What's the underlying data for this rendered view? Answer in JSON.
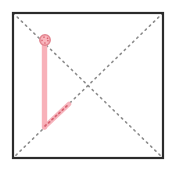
{
  "figure": {
    "canvas": {
      "width": 175,
      "height": 173,
      "background": "#ffffff"
    },
    "square": {
      "label": "square-outline",
      "x": 13,
      "y": 13,
      "width": 150,
      "height": 145,
      "stroke": "#2b2b2b",
      "stroke_width": 2.2,
      "fill": "none"
    },
    "diagonals": [
      {
        "label": "diagonal-top-left-to-bottom-right",
        "x1": 13,
        "y1": 13,
        "x2": 163,
        "y2": 158,
        "stroke": "#8c8c8c",
        "stroke_width": 1.6,
        "dash": "1.6 4.2",
        "style": "dotted"
      },
      {
        "label": "diagonal-top-right-to-bottom-left",
        "x1": 163,
        "y1": 13,
        "x2": 13,
        "y2": 158,
        "stroke": "#8c8c8c",
        "stroke_width": 1.6,
        "dash": "1.6 4.2",
        "style": "dotted"
      }
    ],
    "intersection": {
      "label": "diagonal-crossing-point",
      "x": 88,
      "y": 86
    },
    "highlight": {
      "vertical_segment": {
        "label": "pink-vertical-segment",
        "x1": 44.5,
        "y1": 41,
        "x2": 44.5,
        "y2": 127,
        "stroke": "#f8b1b9",
        "stroke_width": 5.4
      },
      "diagonal_segment": {
        "label": "pink-diagonal-segment",
        "x1": 44.5,
        "y1": 127,
        "x2": 69,
        "y2": 104,
        "stroke": "#f6aeb7",
        "stroke_width": 4.6,
        "opacity": 0.9
      },
      "diagonal_inner_dots": {
        "label": "pink-diagonal-dotted-overlay",
        "x1": 45,
        "y1": 126,
        "x2": 68,
        "y2": 105,
        "stroke": "#d9616f",
        "stroke_width": 1.7,
        "dash": "1.5 3.2"
      },
      "node_marker": {
        "label": "pink-circle-node",
        "cx": 45,
        "cy": 40,
        "r": 5.2,
        "fill": "#f9b6bd",
        "stroke": "#e2848f",
        "stroke_width": 1.5
      },
      "node_inner_dots": {
        "label": "node-dotted-overlay",
        "cx": 45,
        "cy": 40,
        "r": 3.0,
        "stroke": "#d9616f",
        "stroke_width": 1.4,
        "dash": "1.4 2.6"
      }
    },
    "colors": {
      "pink_fill": "#f8b1b9",
      "pink_accent": "#e2848f",
      "rose_dot": "#d9616f",
      "outline": "#2b2b2b",
      "dotted_gray": "#8c8c8c",
      "background": "#ffffff"
    }
  }
}
